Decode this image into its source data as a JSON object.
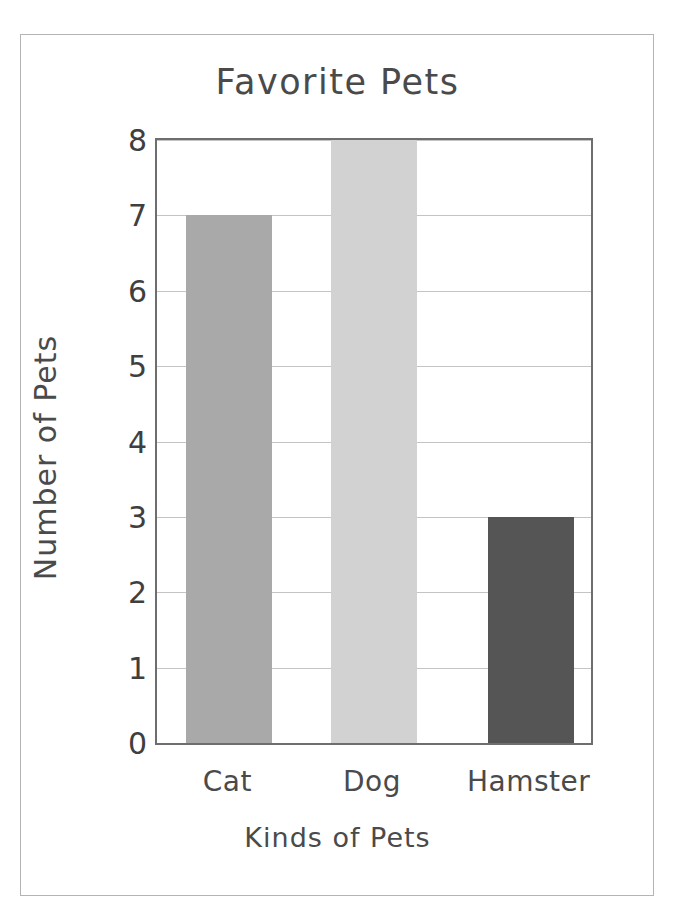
{
  "chart_data": {
    "type": "bar",
    "title": "Favorite Pets",
    "xlabel": "Kinds of Pets",
    "ylabel": "Number of Pets",
    "categories": [
      "Cat",
      "Dog",
      "Hamster"
    ],
    "values": [
      7,
      8,
      3
    ],
    "ylim": [
      0,
      8
    ],
    "yticks": [
      0,
      1,
      2,
      3,
      4,
      5,
      6,
      7,
      8
    ],
    "ytick_labels": [
      "0",
      "1",
      "2",
      "3",
      "4",
      "5",
      "6",
      "7",
      "8"
    ],
    "grid": true,
    "legend": false,
    "bar_colors": [
      "#a9a9a9",
      "#d2d2d2",
      "#555555"
    ],
    "series": [
      {
        "name": "Number of Pets",
        "points": [
          {
            "category": "Cat",
            "value": 7,
            "color": "#a9a9a9"
          },
          {
            "category": "Dog",
            "value": 8,
            "color": "#d2d2d2"
          },
          {
            "category": "Hamster",
            "value": 3,
            "color": "#555555"
          }
        ]
      }
    ]
  },
  "style": {
    "axis_color": "#6e6e6e",
    "grid_color": "#c4c4c4",
    "text_color": "#4a4a4a",
    "frame_color": "#b4b4b4",
    "background": "#ffffff"
  }
}
